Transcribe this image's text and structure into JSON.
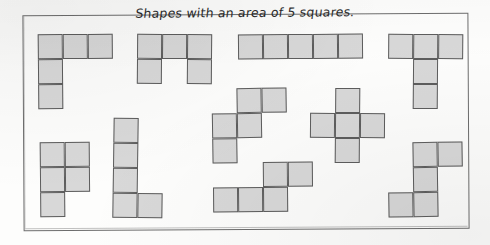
{
  "page": {
    "title_text": "Shapes with an area of 5 squares.",
    "frame_color": "#6d6d6d",
    "cell_fill_color": "#d8d8d8",
    "cell_stroke_color": "#5d5d5d",
    "paper_color": "#fdfdfc",
    "cell_size_px": 25,
    "shape_count": 10,
    "squares_per_shape": 5
  },
  "shapes": [
    {
      "name": "v-pentomino",
      "label": "V pentomino",
      "origin": {
        "x": 38,
        "y": 34
      },
      "cells": [
        [
          0,
          0
        ],
        [
          1,
          0
        ],
        [
          2,
          0
        ],
        [
          0,
          1
        ],
        [
          0,
          2
        ]
      ],
      "tilt": "tilt-a"
    },
    {
      "name": "u-pentomino",
      "label": "U pentomino",
      "origin": {
        "x": 137,
        "y": 34
      },
      "cells": [
        [
          0,
          0
        ],
        [
          1,
          0
        ],
        [
          2,
          0
        ],
        [
          0,
          1
        ],
        [
          2,
          1
        ]
      ],
      "tilt": "tilt-b"
    },
    {
      "name": "i-pentomino",
      "label": "I pentomino",
      "origin": {
        "x": 238,
        "y": 34
      },
      "cells": [
        [
          0,
          0
        ],
        [
          1,
          0
        ],
        [
          2,
          0
        ],
        [
          3,
          0
        ],
        [
          4,
          0
        ]
      ],
      "tilt": "tilt-a"
    },
    {
      "name": "t-pentomino",
      "label": "T pentomino",
      "origin": {
        "x": 388,
        "y": 34
      },
      "cells": [
        [
          0,
          0
        ],
        [
          1,
          0
        ],
        [
          2,
          0
        ],
        [
          1,
          1
        ],
        [
          1,
          2
        ]
      ],
      "tilt": "tilt-b"
    },
    {
      "name": "w-pentomino",
      "label": "W pentomino",
      "origin": {
        "x": 212,
        "y": 88
      },
      "cells": [
        [
          1,
          0
        ],
        [
          2,
          0
        ],
        [
          0,
          1
        ],
        [
          1,
          1
        ],
        [
          0,
          2
        ]
      ],
      "tilt": "tilt-c"
    },
    {
      "name": "x-pentomino",
      "label": "X pentomino",
      "origin": {
        "x": 310,
        "y": 88
      },
      "cells": [
        [
          1,
          0
        ],
        [
          0,
          1
        ],
        [
          1,
          1
        ],
        [
          2,
          1
        ],
        [
          1,
          2
        ]
      ],
      "tilt": "tilt-b"
    },
    {
      "name": "p-pentomino",
      "label": "P pentomino",
      "origin": {
        "x": 40,
        "y": 142
      },
      "cells": [
        [
          0,
          0
        ],
        [
          1,
          0
        ],
        [
          0,
          1
        ],
        [
          1,
          1
        ],
        [
          0,
          2
        ]
      ],
      "tilt": "tilt-a"
    },
    {
      "name": "l-pentomino",
      "label": "L pentomino",
      "origin": {
        "x": 113,
        "y": 118
      },
      "cells": [
        [
          0,
          0
        ],
        [
          0,
          1
        ],
        [
          0,
          2
        ],
        [
          0,
          3
        ],
        [
          1,
          3
        ]
      ],
      "tilt": "tilt-d"
    },
    {
      "name": "n-pentomino",
      "label": "N pentomino",
      "origin": {
        "x": 213,
        "y": 162
      },
      "cells": [
        [
          2,
          0
        ],
        [
          3,
          0
        ],
        [
          0,
          1
        ],
        [
          1,
          1
        ],
        [
          2,
          1
        ]
      ],
      "tilt": "tilt-a"
    },
    {
      "name": "z-pentomino",
      "label": "Z pentomino",
      "origin": {
        "x": 388,
        "y": 142
      },
      "cells": [
        [
          1,
          0
        ],
        [
          2,
          0
        ],
        [
          1,
          1
        ],
        [
          0,
          2
        ],
        [
          1,
          2
        ]
      ],
      "tilt": "tilt-c"
    }
  ]
}
